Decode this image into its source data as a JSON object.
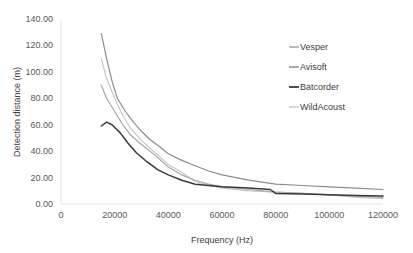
{
  "chart_data": {
    "type": "line",
    "title": "",
    "xlabel": "Frequency (Hz)",
    "ylabel": "Detection distance (m)",
    "xlim": [
      0,
      120000
    ],
    "ylim": [
      0,
      140
    ],
    "x_ticks": [
      "0",
      "20000",
      "40000",
      "60000",
      "80000",
      "100000",
      "120000"
    ],
    "y_ticks": [
      "0.00",
      "20.00",
      "40.00",
      "60.00",
      "80.00",
      "100.00",
      "120.00",
      "140.00"
    ],
    "grid": false,
    "legend_position": "right",
    "series": [
      {
        "name": "Vesper",
        "color": "#a6a6a6",
        "width": 1.2,
        "points": [
          [
            15000,
            90
          ],
          [
            17000,
            80
          ],
          [
            20000,
            70
          ],
          [
            23000,
            60
          ],
          [
            26000,
            52
          ],
          [
            30000,
            45
          ],
          [
            35000,
            37
          ],
          [
            40000,
            28
          ],
          [
            45000,
            22
          ],
          [
            50000,
            18
          ],
          [
            55000,
            15
          ],
          [
            60000,
            13
          ],
          [
            70000,
            11
          ],
          [
            80000,
            9
          ],
          [
            90000,
            8
          ],
          [
            100000,
            7
          ],
          [
            110000,
            6
          ],
          [
            120000,
            5
          ]
        ]
      },
      {
        "name": "Avisoft",
        "color": "#8c8c8c",
        "width": 1.2,
        "points": [
          [
            15000,
            129
          ],
          [
            17000,
            110
          ],
          [
            19000,
            93
          ],
          [
            21000,
            80
          ],
          [
            24000,
            70
          ],
          [
            27000,
            62
          ],
          [
            30000,
            55
          ],
          [
            33000,
            49
          ],
          [
            37000,
            43
          ],
          [
            40000,
            38
          ],
          [
            45000,
            33
          ],
          [
            50000,
            29
          ],
          [
            55000,
            25
          ],
          [
            60000,
            22
          ],
          [
            70000,
            18
          ],
          [
            80000,
            15
          ],
          [
            90000,
            14
          ],
          [
            100000,
            13
          ],
          [
            110000,
            12
          ],
          [
            120000,
            11
          ]
        ]
      },
      {
        "name": "Batcorder",
        "color": "#3a3a3a",
        "width": 1.5,
        "points": [
          [
            15000,
            59
          ],
          [
            17000,
            62
          ],
          [
            19000,
            60
          ],
          [
            22000,
            54
          ],
          [
            25000,
            46
          ],
          [
            28000,
            39
          ],
          [
            32000,
            32
          ],
          [
            36000,
            26
          ],
          [
            40000,
            22
          ],
          [
            45000,
            18
          ],
          [
            50000,
            15
          ],
          [
            55000,
            14
          ],
          [
            60000,
            13
          ],
          [
            70000,
            12
          ],
          [
            78000,
            11
          ],
          [
            80000,
            8
          ],
          [
            90000,
            7.5
          ],
          [
            100000,
            7
          ],
          [
            110000,
            6.5
          ],
          [
            120000,
            6
          ]
        ]
      },
      {
        "name": "WildAcoust",
        "color": "#c8c8c8",
        "width": 1.2,
        "points": [
          [
            15000,
            110
          ],
          [
            17000,
            95
          ],
          [
            20000,
            80
          ],
          [
            23000,
            67
          ],
          [
            26000,
            57
          ],
          [
            30000,
            48
          ],
          [
            35000,
            39
          ],
          [
            40000,
            30
          ],
          [
            45000,
            24
          ],
          [
            50000,
            17
          ],
          [
            55000,
            14
          ],
          [
            60000,
            12
          ],
          [
            70000,
            10
          ],
          [
            80000,
            9
          ],
          [
            90000,
            8
          ],
          [
            100000,
            7
          ],
          [
            110000,
            5
          ],
          [
            120000,
            4
          ]
        ]
      }
    ]
  },
  "plot": {
    "left": 61,
    "right": 383,
    "top": 19,
    "bottom": 204
  }
}
